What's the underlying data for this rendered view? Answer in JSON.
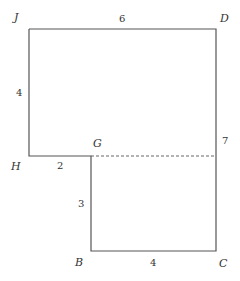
{
  "diagram": {
    "vertices": [
      "J",
      "D",
      "C",
      "B",
      "G",
      "H"
    ],
    "vertex_labels": {
      "J": "J",
      "D": "D",
      "C": "C",
      "B": "B",
      "G": "G",
      "H": "H"
    },
    "edges": [
      {
        "from": "J",
        "to": "D",
        "length": "6"
      },
      {
        "from": "J",
        "to": "H",
        "length": "4"
      },
      {
        "from": "H",
        "to": "G",
        "length": "2"
      },
      {
        "from": "G",
        "to": "B",
        "length": "3"
      },
      {
        "from": "B",
        "to": "C",
        "length": "4"
      },
      {
        "from": "D",
        "to": "C",
        "length": "7"
      }
    ],
    "dashed_segment": {
      "from": "G",
      "to": "DC-side",
      "style": "dashed"
    }
  }
}
